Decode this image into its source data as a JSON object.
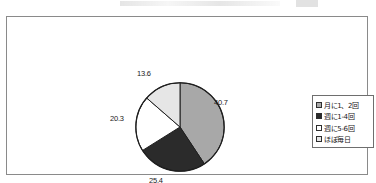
{
  "chart_data": {
    "type": "pie",
    "title": "",
    "xlabel": "",
    "ylabel": "",
    "categories": [
      "月に1、2回",
      "週に1-4回",
      "週に5-6回",
      "ほぼ毎日"
    ],
    "values": [
      40.7,
      25.4,
      20.3,
      13.6
    ],
    "value_labels": [
      "40.7",
      "25.4",
      "20.3",
      "13.6"
    ],
    "colors": [
      "#a8a8a8",
      "#2b2b2b",
      "#ffffff",
      "#e6e6e6"
    ],
    "legend_position": "right",
    "grid": false,
    "start_angle_deg": 0,
    "direction": "clockwise",
    "units": "%"
  },
  "legend": {
    "items": [
      {
        "label": "月に1、2回",
        "color": "#a8a8a8"
      },
      {
        "label": "週に1-4回",
        "color": "#2b2b2b"
      },
      {
        "label": "週に5-6回",
        "color": "#ffffff"
      },
      {
        "label": "ほぼ毎日",
        "color": "#e6e6e6"
      }
    ]
  }
}
